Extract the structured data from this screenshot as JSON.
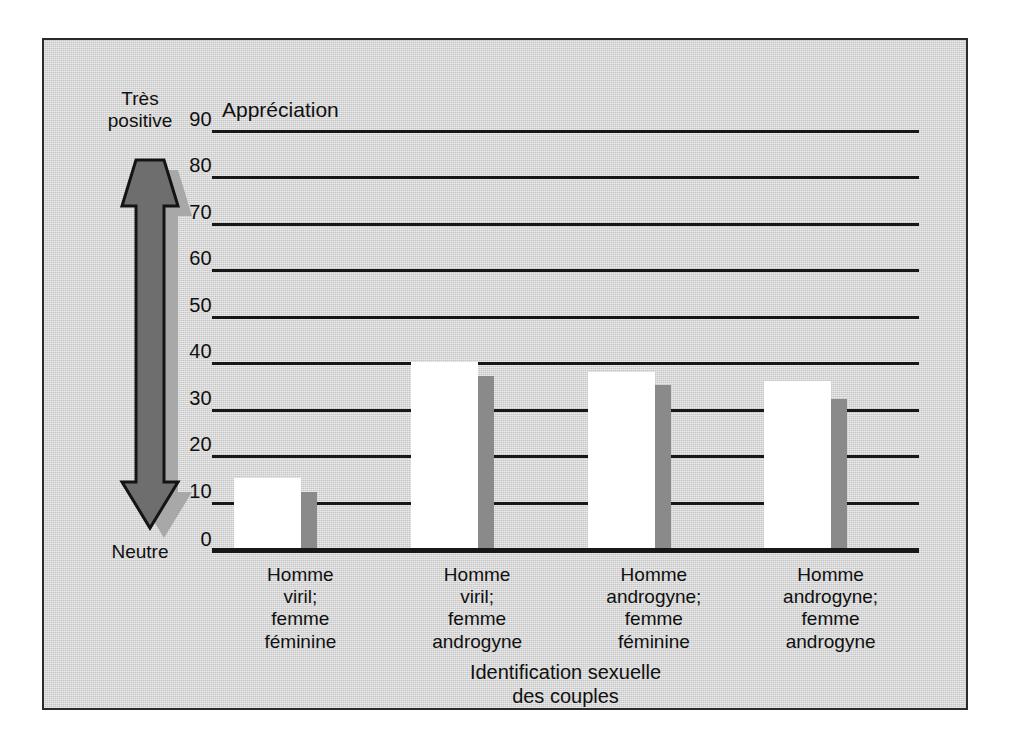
{
  "figure": {
    "panel_background": "#d4d4d4",
    "frame_color": "#2b2b2b"
  },
  "axis_scale": {
    "top_label": "Très\npositive",
    "bottom_label": "Neutre",
    "arrow_fill": "#6e6e6e",
    "arrow_shadow": "#a8a8a8",
    "arrow_outline": "#141414"
  },
  "chart_data": {
    "type": "bar",
    "title": "",
    "ylabel": "Appréciation",
    "xlabel": "Identification sexuelle\ndes couples",
    "ylim": [
      0,
      90
    ],
    "yticks": [
      0,
      10,
      20,
      30,
      40,
      50,
      60,
      70,
      80,
      90
    ],
    "grid": true,
    "legend": "none",
    "categories": [
      "Homme\nviril;\nfemme\nféminine",
      "Homme\nviril;\nfemme\nandrogyne",
      "Homme\nandrogyne;\nfemme\nféminine",
      "Homme\nandrogyne;\nfemme\nandrogyne"
    ],
    "series": [
      {
        "name": "Barre claire",
        "color": "#ffffff",
        "values": [
          15,
          40,
          38,
          36
        ]
      },
      {
        "name": "Barre foncée",
        "color": "#8a8a8a",
        "values": [
          12,
          37,
          35,
          32
        ]
      }
    ]
  }
}
